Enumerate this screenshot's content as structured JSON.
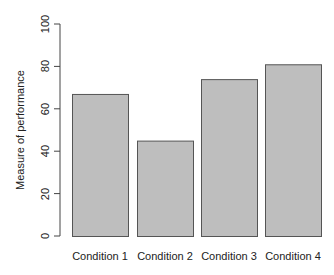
{
  "chart_data": {
    "type": "bar",
    "title": "",
    "xlabel": "",
    "ylabel": "Measure of performance",
    "categories": [
      "Condition 1",
      "Condition 2",
      "Condition 3",
      "Condition 4"
    ],
    "values": [
      67,
      45,
      74,
      81
    ],
    "ylim": [
      0,
      100
    ],
    "yticks": [
      0,
      20,
      40,
      60,
      80,
      100
    ],
    "grid": false,
    "legend": null,
    "colors": {
      "bar_fill": "#bebebe",
      "bar_border": "#555555",
      "axis": "#444444"
    }
  }
}
